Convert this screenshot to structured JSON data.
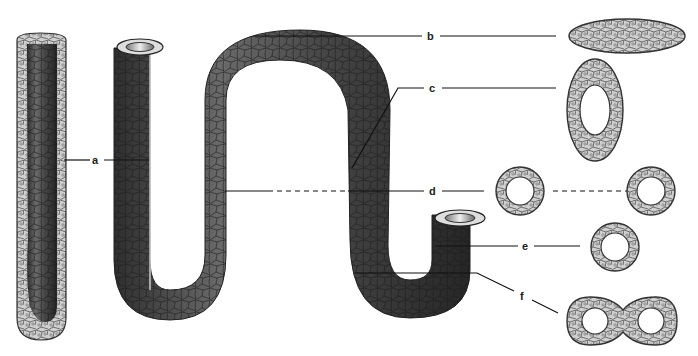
{
  "diagram": {
    "type": "biology-illustration",
    "labels": [
      {
        "id": "a",
        "text": "a",
        "x": 96,
        "y": 160,
        "section": "longitudinal-section"
      },
      {
        "id": "b",
        "text": "b",
        "x": 430,
        "y": 36,
        "section": "flattened-solid-ellipse"
      },
      {
        "id": "c",
        "text": "c",
        "x": 432,
        "y": 88,
        "section": "oval-with-lumen"
      },
      {
        "id": "d",
        "text": "d",
        "x": 432,
        "y": 191,
        "section": "round-ring-pair"
      },
      {
        "id": "e",
        "text": "e",
        "x": 526,
        "y": 248,
        "section": "round-ring"
      },
      {
        "id": "f",
        "text": "f",
        "x": 522,
        "y": 296,
        "section": "figure-eight-double-lumen"
      }
    ],
    "colors": {
      "tube_dark": "#3a3a3a",
      "tube_mid": "#5a5a5a",
      "cell_fill": "#c8c8c8",
      "cell_edge": "#444444",
      "line": "#111111",
      "background": "#ffffff"
    }
  }
}
